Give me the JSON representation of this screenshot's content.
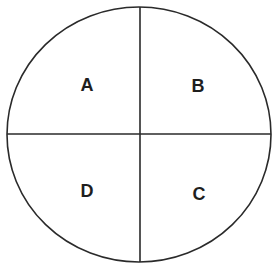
{
  "diagram": {
    "type": "circle-quadrants",
    "stroke_color": "#2a2a2a",
    "background": "#ffffff",
    "circle": {
      "cx": 139,
      "cy": 134.5,
      "rx": 132,
      "ry": 127.5
    },
    "divider": {
      "x": 140,
      "y": 134
    },
    "quadrants": [
      {
        "position": "top-left",
        "label": "A",
        "x": 87,
        "y": 84
      },
      {
        "position": "top-right",
        "label": "B",
        "x": 198,
        "y": 85
      },
      {
        "position": "bottom-right",
        "label": "C",
        "x": 199,
        "y": 193
      },
      {
        "position": "bottom-left",
        "label": "D",
        "x": 87,
        "y": 190
      }
    ]
  }
}
